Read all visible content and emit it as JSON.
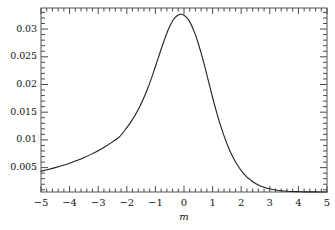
{
  "chart_data": {
    "type": "line",
    "title": "",
    "xlabel": "m",
    "ylabel": "",
    "xlim": [
      -5,
      5
    ],
    "ylim": [
      0.0006,
      0.0338
    ],
    "grid": false,
    "legend": null,
    "x_ticks": [
      "-5",
      "-4",
      "-3",
      "-2",
      "-1",
      "0",
      "1",
      "2",
      "3",
      "4",
      "5"
    ],
    "x_tick_values": [
      -5,
      -4,
      -3,
      -2,
      -1,
      0,
      1,
      2,
      3,
      4,
      5
    ],
    "y_ticks": [
      "0.005",
      "0.01",
      "0.015",
      "0.02",
      "0.025",
      "0.03"
    ],
    "y_tick_values": [
      0.005,
      0.01,
      0.015,
      0.02,
      0.025,
      0.03
    ],
    "x_minor_per_major": 5,
    "y_minor_per_major": 5,
    "series": [
      {
        "name": "distribution",
        "color": "#1f1f1f",
        "x": [
          -5.0,
          -4.75,
          -4.5,
          -4.25,
          -4.0,
          -3.75,
          -3.5,
          -3.25,
          -3.0,
          -2.75,
          -2.5,
          -2.25,
          -2.0,
          -1.85,
          -1.7,
          -1.55,
          -1.4,
          -1.25,
          -1.1,
          -1.0,
          -0.9,
          -0.8,
          -0.7,
          -0.6,
          -0.5,
          -0.4,
          -0.3,
          -0.2,
          -0.1,
          0.0,
          0.1,
          0.2,
          0.3,
          0.4,
          0.5,
          0.6,
          0.7,
          0.8,
          0.9,
          1.0,
          1.15,
          1.3,
          1.45,
          1.6,
          1.75,
          1.9,
          2.05,
          2.2,
          2.35,
          2.5,
          2.65,
          2.8,
          2.95,
          3.1,
          3.3,
          3.5,
          3.75,
          4.0,
          4.25,
          4.5,
          4.75,
          5.0
        ],
        "y": [
          0.00435,
          0.00465,
          0.005,
          0.00538,
          0.0058,
          0.00627,
          0.0068,
          0.00739,
          0.00806,
          0.00881,
          0.00965,
          0.0106,
          0.01221,
          0.0133,
          0.01455,
          0.016,
          0.01765,
          0.01955,
          0.0217,
          0.02325,
          0.0248,
          0.02635,
          0.02785,
          0.02925,
          0.03045,
          0.03145,
          0.03215,
          0.03255,
          0.03268,
          0.0325,
          0.03205,
          0.0313,
          0.03025,
          0.02895,
          0.0274,
          0.02565,
          0.02375,
          0.02175,
          0.0197,
          0.01765,
          0.0148,
          0.01225,
          0.01,
          0.0081,
          0.0065,
          0.0052,
          0.00415,
          0.0033,
          0.00268,
          0.00215,
          0.00175,
          0.00145,
          0.00122,
          0.00105,
          0.00088,
          0.00078,
          0.0007,
          0.00066,
          0.00063,
          0.00062,
          0.00061,
          0.0006
        ]
      }
    ]
  },
  "axes": {
    "x_axis_title": "m",
    "frame_color": "#4a4a4a"
  }
}
